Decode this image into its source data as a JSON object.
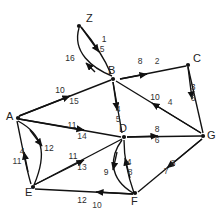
{
  "diagram": {
    "type": "directed-weighted-graph",
    "title": "",
    "nodes": [
      {
        "id": "Z",
        "label": "Z",
        "x": 78,
        "y": 24
      },
      {
        "id": "B",
        "label": "B",
        "x": 113,
        "y": 78
      },
      {
        "id": "C",
        "label": "C",
        "x": 189,
        "y": 63
      },
      {
        "id": "A",
        "label": "A",
        "x": 16,
        "y": 118
      },
      {
        "id": "D",
        "label": "D",
        "x": 124,
        "y": 136
      },
      {
        "id": "G",
        "label": "G",
        "x": 204,
        "y": 136
      },
      {
        "id": "E",
        "label": "E",
        "x": 31,
        "y": 187
      },
      {
        "id": "F",
        "label": "F",
        "x": 136,
        "y": 196
      }
    ],
    "edges": [
      {
        "from": "Z",
        "to": "B",
        "labels": [
          "1",
          "5"
        ],
        "label_x": 104,
        "label_y": 42,
        "label2_x": 102,
        "label2_y": 52
      },
      {
        "from": "B",
        "to": "Z",
        "labels": [
          "16"
        ],
        "label_x": 70,
        "label_y": 61,
        "label2_x": null,
        "label2_y": null
      },
      {
        "from": "B",
        "to": "C",
        "labels": [
          "8",
          "2"
        ],
        "label_x": 140,
        "label_y": 64,
        "label2_x": 157,
        "label2_y": 64
      },
      {
        "from": "C",
        "to": "G",
        "labels": [
          "3",
          "6"
        ],
        "label_x": 193,
        "label_y": 90,
        "label2_x": 193,
        "label2_y": 101
      },
      {
        "from": "G",
        "to": "B",
        "labels": [
          "10",
          "4"
        ],
        "label_x": 155,
        "label_y": 100,
        "label2_x": 170,
        "label2_y": 105
      },
      {
        "from": "A",
        "to": "B",
        "labels": [
          "10",
          "15"
        ],
        "label_x": 60,
        "label_y": 93,
        "label2_x": 74,
        "label2_y": 104
      },
      {
        "from": "A",
        "to": "D",
        "labels": [
          "11",
          "14"
        ],
        "label_x": 72,
        "label_y": 128,
        "label2_x": 82,
        "label2_y": 139
      },
      {
        "from": "B",
        "to": "D",
        "labels": [
          "4",
          "5"
        ],
        "label_x": 118,
        "label_y": 112,
        "label2_x": 118,
        "label2_y": 122
      },
      {
        "from": "D",
        "to": "G",
        "labels": [
          "8",
          "6"
        ],
        "label_x": 157,
        "label_y": 132,
        "label2_x": 157,
        "label2_y": 143
      },
      {
        "from": "E",
        "to": "A",
        "labels": [
          "4",
          "11"
        ],
        "label_x": 22,
        "label_y": 154,
        "label2_x": 17,
        "label2_y": 164
      },
      {
        "from": "A",
        "to": "E",
        "labels": [
          "12"
        ],
        "label_x": 49,
        "label_y": 151,
        "label2_x": null,
        "label2_y": null
      },
      {
        "from": "E",
        "to": "D",
        "labels": [
          "11",
          "13"
        ],
        "label_x": 73,
        "label_y": 159,
        "label2_x": 82,
        "label2_y": 170
      },
      {
        "from": "D",
        "to": "F",
        "labels": [
          "9"
        ],
        "label_x": 106,
        "label_y": 175,
        "label2_x": null,
        "label2_y": null
      },
      {
        "from": "F",
        "to": "D",
        "labels": [
          "4",
          "8"
        ],
        "label_x": 129,
        "label_y": 165,
        "label2_x": 130,
        "label2_y": 175
      },
      {
        "from": "F",
        "to": "E",
        "labels": [
          "12",
          "10"
        ],
        "label_x": 82,
        "label_y": 203,
        "label2_x": 97,
        "label2_y": 208
      },
      {
        "from": "G",
        "to": "F",
        "labels": [
          "8",
          "7"
        ],
        "label_x": 173,
        "label_y": 166,
        "label2_x": 166,
        "label2_y": 174
      }
    ],
    "colors": {
      "stroke": "#111111",
      "label": "#2a2a2a",
      "background": "#ffffff"
    }
  }
}
